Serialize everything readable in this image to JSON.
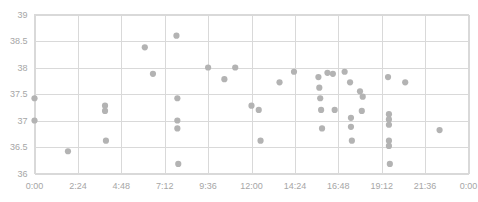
{
  "chart_data": {
    "type": "scatter",
    "title": "",
    "subtitle": "",
    "xlabel": "",
    "ylabel": "",
    "grid": true,
    "legend": false,
    "legend_position": "none",
    "point_color": "#b3b3b3",
    "grid_color": "#d9d9d9",
    "axis_text_color": "#a6a6a6",
    "x_axis": {
      "type": "time",
      "min_hours": 0,
      "max_hours": 24,
      "tick_interval_hours": 2.4,
      "tick_labels": [
        "0:00",
        "2:24",
        "4:48",
        "7:12",
        "9:36",
        "12:00",
        "14:24",
        "16:48",
        "19:12",
        "21:36",
        "0:00"
      ],
      "tick_values_hours": [
        0,
        2.4,
        4.8,
        7.2,
        9.6,
        12,
        14.4,
        16.8,
        19.2,
        21.6,
        24
      ]
    },
    "y_axis": {
      "min": 36,
      "max": 39,
      "tick_interval": 0.5,
      "tick_labels": [
        "36",
        "36.5",
        "37",
        "37.5",
        "38",
        "38.5",
        "39"
      ],
      "tick_values": [
        36,
        36.5,
        37,
        37.5,
        38,
        38.5,
        39
      ]
    },
    "points": [
      {
        "x": 0.0,
        "y": 37.42
      },
      {
        "x": 0.0,
        "y": 37.0
      },
      {
        "x": 1.85,
        "y": 36.42
      },
      {
        "x": 3.9,
        "y": 37.28
      },
      {
        "x": 3.9,
        "y": 37.18
      },
      {
        "x": 3.95,
        "y": 36.62
      },
      {
        "x": 6.1,
        "y": 38.38
      },
      {
        "x": 6.55,
        "y": 37.88
      },
      {
        "x": 7.85,
        "y": 38.6
      },
      {
        "x": 7.9,
        "y": 37.42
      },
      {
        "x": 7.9,
        "y": 37.0
      },
      {
        "x": 7.9,
        "y": 36.85
      },
      {
        "x": 7.95,
        "y": 36.18
      },
      {
        "x": 9.6,
        "y": 38.0
      },
      {
        "x": 10.5,
        "y": 37.78
      },
      {
        "x": 11.1,
        "y": 38.0
      },
      {
        "x": 12.0,
        "y": 37.28
      },
      {
        "x": 12.4,
        "y": 37.2
      },
      {
        "x": 12.5,
        "y": 36.62
      },
      {
        "x": 13.55,
        "y": 37.72
      },
      {
        "x": 14.35,
        "y": 37.92
      },
      {
        "x": 15.7,
        "y": 37.82
      },
      {
        "x": 15.75,
        "y": 37.62
      },
      {
        "x": 15.8,
        "y": 37.42
      },
      {
        "x": 15.85,
        "y": 37.2
      },
      {
        "x": 15.9,
        "y": 36.85
      },
      {
        "x": 16.2,
        "y": 37.9
      },
      {
        "x": 16.5,
        "y": 37.88
      },
      {
        "x": 16.6,
        "y": 37.2
      },
      {
        "x": 17.15,
        "y": 37.92
      },
      {
        "x": 17.45,
        "y": 37.72
      },
      {
        "x": 17.5,
        "y": 37.05
      },
      {
        "x": 17.5,
        "y": 36.88
      },
      {
        "x": 17.55,
        "y": 36.62
      },
      {
        "x": 18.0,
        "y": 37.55
      },
      {
        "x": 18.1,
        "y": 37.18
      },
      {
        "x": 18.15,
        "y": 37.45
      },
      {
        "x": 19.55,
        "y": 37.82
      },
      {
        "x": 19.6,
        "y": 37.12
      },
      {
        "x": 19.6,
        "y": 37.02
      },
      {
        "x": 19.6,
        "y": 36.92
      },
      {
        "x": 19.6,
        "y": 36.62
      },
      {
        "x": 19.6,
        "y": 36.52
      },
      {
        "x": 19.65,
        "y": 36.18
      },
      {
        "x": 20.5,
        "y": 37.72
      },
      {
        "x": 22.4,
        "y": 36.82
      }
    ]
  },
  "axis_labels": {
    "y": [
      "39",
      "38.5",
      "38",
      "37.5",
      "37",
      "36.5",
      "36"
    ],
    "x": [
      "0:00",
      "2:24",
      "4:48",
      "7:12",
      "9:36",
      "12:00",
      "14:24",
      "16:48",
      "19:12",
      "21:36",
      "0:00"
    ]
  }
}
